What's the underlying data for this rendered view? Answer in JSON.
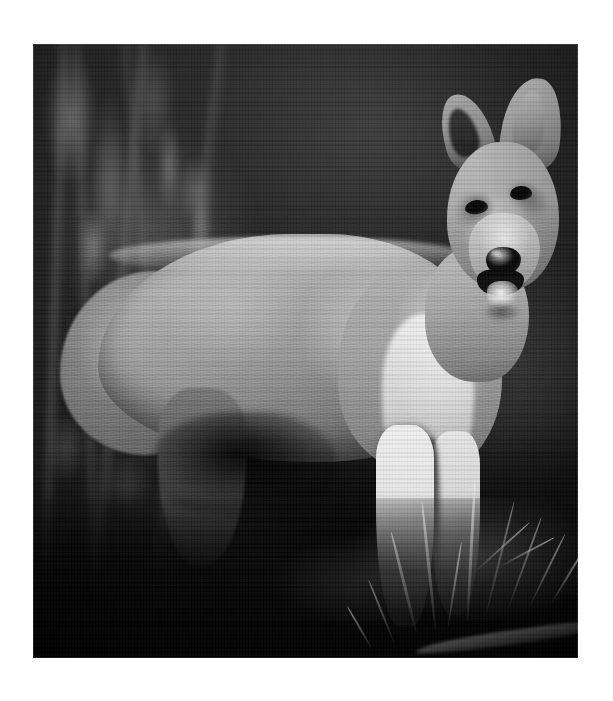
{
  "page": {
    "background_color": "#ffffff",
    "kind": "printed-photograph-page"
  },
  "photograph": {
    "title": "Wolf pup standing in grass",
    "alt_text": "Black and white photograph of a young wolf pup standing on grassy ground, facing the camera with its mouth open and tongue showing",
    "color_mode": "Black and white",
    "orientation": "Portrait",
    "frame": {
      "left_px": 33,
      "top_px": 44,
      "width_px": 545,
      "height_px": 614
    },
    "subject": {
      "animal": "wolf pup",
      "pose": "standing, body in left profile, head turned toward viewer",
      "mouth": "open with tongue visible",
      "ears": "both erect and alert",
      "nose_color": "#0e0c0a",
      "fur_tone": "#a8a29a",
      "highlight_tone": "#efece7",
      "shadow_tone": "#3a3630"
    },
    "scene": {
      "setting": "woodland undergrowth",
      "background": "dark out-of-focus foliage and stems",
      "foreground": "shadowed ground with grass blades and a fallen log",
      "lighting": "strong side light from upper right",
      "background_tone": "#1d1d1d",
      "ground_tone": "#0a0a09"
    },
    "grass_blades": [
      {
        "left": 70.0,
        "bottom": 4.0,
        "height": 17.0,
        "width": 0.5,
        "rotate": -14
      },
      {
        "left": 73.5,
        "bottom": 4.5,
        "height": 21.0,
        "width": 0.5,
        "rotate": -6
      },
      {
        "left": 76.0,
        "bottom": 5.0,
        "height": 14.0,
        "width": 0.4,
        "rotate": 9
      },
      {
        "left": 79.5,
        "bottom": 6.0,
        "height": 23.0,
        "width": 0.5,
        "rotate": 3
      },
      {
        "left": 83.0,
        "bottom": 7.0,
        "height": 19.0,
        "width": 0.45,
        "rotate": 14
      },
      {
        "left": 87.0,
        "bottom": 8.0,
        "height": 16.0,
        "width": 0.4,
        "rotate": 20
      },
      {
        "left": 91.0,
        "bottom": 8.5,
        "height": 13.0,
        "width": 0.4,
        "rotate": 26
      },
      {
        "left": 95.0,
        "bottom": 9.0,
        "height": 11.0,
        "width": 0.35,
        "rotate": 31
      },
      {
        "left": 66.0,
        "bottom": 2.5,
        "height": 11.0,
        "width": 0.4,
        "rotate": -22
      },
      {
        "left": 62.0,
        "bottom": 1.5,
        "height": 8.0,
        "width": 0.35,
        "rotate": -30
      },
      {
        "left": 81.0,
        "bottom": 14.0,
        "height": 12.0,
        "width": 0.4,
        "rotate": 48
      },
      {
        "left": 85.5,
        "bottom": 15.0,
        "height": 10.0,
        "width": 0.35,
        "rotate": 62
      }
    ]
  },
  "caption": {
    "text": ""
  }
}
